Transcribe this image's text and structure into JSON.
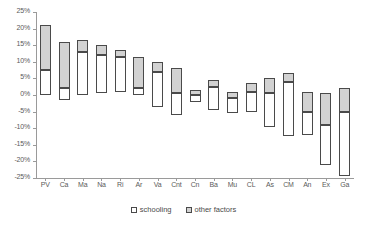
{
  "chart_data": {
    "type": "bar",
    "title": "",
    "xlabel": "",
    "ylabel": "",
    "ylim": [
      -25,
      25
    ],
    "ytick_values": [
      25,
      20,
      15,
      10,
      5,
      0,
      -5,
      -10,
      -15,
      -20,
      -25
    ],
    "ytick_labels": [
      "25%",
      "20%",
      "15%",
      "10%",
      "5%",
      "0%",
      "-5%",
      "-10%",
      "-15%",
      "-20%",
      "-25%"
    ],
    "grid": false,
    "legend_position": "bottom",
    "legend": [
      {
        "key": "schooling",
        "label": "schooling",
        "color": "#ffffff"
      },
      {
        "key": "other",
        "label": "other factors",
        "color": "#d2d2d2"
      }
    ],
    "categories": [
      "PV",
      "Ca",
      "Ma",
      "Na",
      "Ri",
      "Ar",
      "Va",
      "Cnt",
      "Cn",
      "Ba",
      "Mu",
      "CL",
      "As",
      "CM",
      "An",
      "Ex",
      "Ga"
    ],
    "note": "Each category is a stacked range bar: the 'schooling' segment and the 'other factors' segment together span from the bar bottom to the bar top.",
    "bars": [
      {
        "category": "PV",
        "top": 21.0,
        "split": 7.5,
        "bottom": 0.0
      },
      {
        "category": "Ca",
        "split": 2.0,
        "top": 16.0,
        "bottom": -1.5
      },
      {
        "category": "Ma",
        "top": 16.5,
        "split": 13.0,
        "bottom": 0.0
      },
      {
        "category": "Na",
        "top": 15.0,
        "split": 12.0,
        "bottom": 0.5
      },
      {
        "category": "Ri",
        "top": 13.5,
        "split": 11.5,
        "bottom": 1.0
      },
      {
        "category": "Ar",
        "top": 11.5,
        "split": 2.0,
        "bottom": 0.0
      },
      {
        "category": "Va",
        "top": 10.0,
        "split": 7.0,
        "bottom": -3.5
      },
      {
        "category": "Cnt",
        "top": 8.0,
        "split": 0.5,
        "bottom": -6.0
      },
      {
        "category": "Cn",
        "top": 1.5,
        "split": 0.0,
        "bottom": -2.0
      },
      {
        "category": "Ba",
        "top": 4.5,
        "split": 2.5,
        "bottom": -4.5
      },
      {
        "category": "Mu",
        "top": 1.0,
        "split": -1.0,
        "bottom": -5.5
      },
      {
        "category": "CL",
        "top": 3.5,
        "split": 1.0,
        "bottom": -5.0
      },
      {
        "category": "As",
        "top": 5.0,
        "split": 0.5,
        "bottom": -9.5
      },
      {
        "category": "CM",
        "top": 6.5,
        "split": 4.0,
        "bottom": -12.5
      },
      {
        "category": "An",
        "top": 1.0,
        "split": -5.0,
        "bottom": -12.0
      },
      {
        "category": "Ex",
        "top": 0.5,
        "split": -9.0,
        "bottom": -21.0
      },
      {
        "category": "Ga",
        "top": 2.0,
        "split": -5.0,
        "bottom": -24.5
      }
    ]
  }
}
